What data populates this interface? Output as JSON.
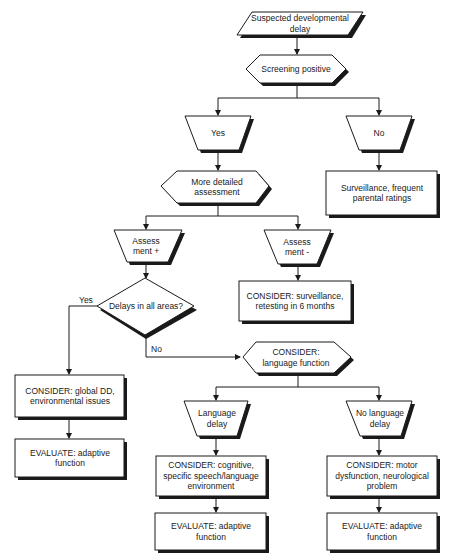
{
  "diagram": {
    "nodes": {
      "suspected": {
        "label": "Suspected developmental delay",
        "shape": "parallelogram"
      },
      "screening": {
        "label": "Screening positive",
        "shape": "hexagon"
      },
      "yes_screen": {
        "label": "Yes",
        "shape": "trapezoid"
      },
      "no_screen": {
        "label": "No",
        "shape": "trapezoid"
      },
      "surveillance": {
        "label": "Surveillance, frequent parental ratings",
        "shape": "rectangle"
      },
      "detailed": {
        "label": "More detailed assessment",
        "shape": "hexagon"
      },
      "assess_plus": {
        "label": "Assess ment +",
        "shape": "trapezoid"
      },
      "assess_minus": {
        "label": "Assess ment -",
        "shape": "trapezoid"
      },
      "consider_retest": {
        "label": "CONSIDER: surveillance, retesting in 6 months",
        "shape": "rectangle"
      },
      "delays_all": {
        "label": "Delays in all areas?",
        "shape": "diamond"
      },
      "consider_global": {
        "label": "CONSIDER: global DD, environmental issues",
        "shape": "rectangle"
      },
      "evaluate_left": {
        "label": "EVALUATE: adaptive function",
        "shape": "rectangle"
      },
      "consider_language": {
        "label": "CONSIDER: language function",
        "shape": "hexagon"
      },
      "language_delay": {
        "label": "Language delay",
        "shape": "trapezoid"
      },
      "no_language_delay": {
        "label": "No language delay",
        "shape": "trapezoid"
      },
      "consider_cognitive": {
        "label": "CONSIDER: cognitive, specific speech/language environment",
        "shape": "rectangle"
      },
      "consider_motor": {
        "label": "CONSIDER: motor dysfunction, neurological problem",
        "shape": "rectangle"
      },
      "evaluate_mid": {
        "label": "EVALUATE: adaptive function",
        "shape": "rectangle"
      },
      "evaluate_right": {
        "label": "EVALUATE: adaptive function",
        "shape": "rectangle"
      }
    },
    "edge_labels": {
      "yes": "Yes",
      "no": "No"
    },
    "edges": [
      [
        "suspected",
        "screening"
      ],
      [
        "screening",
        "yes_screen"
      ],
      [
        "screening",
        "no_screen"
      ],
      [
        "no_screen",
        "surveillance"
      ],
      [
        "yes_screen",
        "detailed"
      ],
      [
        "detailed",
        "assess_plus"
      ],
      [
        "detailed",
        "assess_minus"
      ],
      [
        "assess_minus",
        "consider_retest"
      ],
      [
        "assess_plus",
        "delays_all"
      ],
      [
        "delays_all",
        "consider_global",
        "Yes"
      ],
      [
        "consider_global",
        "evaluate_left"
      ],
      [
        "delays_all",
        "consider_language",
        "No"
      ],
      [
        "consider_language",
        "language_delay"
      ],
      [
        "consider_language",
        "no_language_delay"
      ],
      [
        "language_delay",
        "consider_cognitive"
      ],
      [
        "no_language_delay",
        "consider_motor"
      ],
      [
        "consider_cognitive",
        "evaluate_mid"
      ],
      [
        "consider_motor",
        "evaluate_right"
      ]
    ]
  }
}
